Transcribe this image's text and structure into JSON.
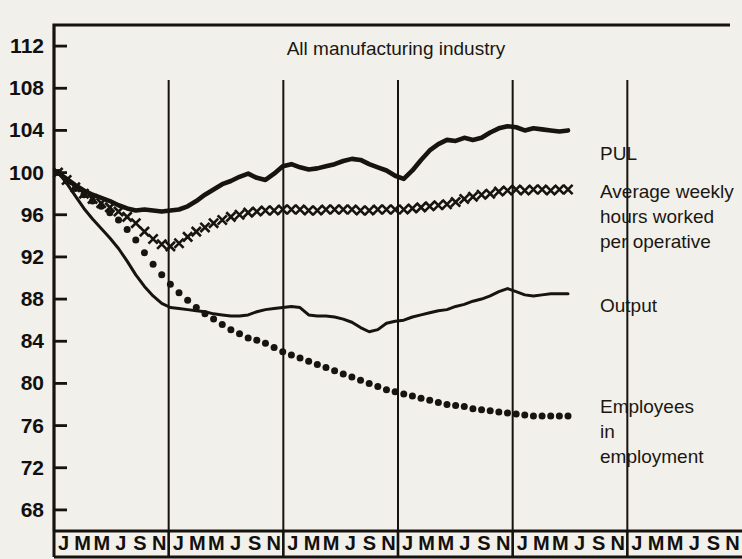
{
  "chart_data": {
    "type": "line",
    "title": "All manufacturing industry",
    "xlabel": "",
    "ylabel": "",
    "ylim": [
      66,
      114
    ],
    "yticks": [
      68,
      72,
      76,
      80,
      84,
      88,
      92,
      96,
      100,
      104,
      108,
      112
    ],
    "grid": "vertical year dividers only",
    "legend_position": "right",
    "x_tick_labels": [
      "J",
      "M",
      "M",
      "J",
      "S",
      "N",
      "J",
      "M",
      "M",
      "J",
      "S",
      "N",
      "J",
      "M",
      "M",
      "J",
      "S",
      "N",
      "J",
      "M",
      "M",
      "J",
      "S",
      "N",
      "J",
      "M",
      "M",
      "J",
      "S",
      "N",
      "J",
      "M",
      "M",
      "J",
      "S",
      "N"
    ],
    "x_group_pattern": [
      "J",
      "M",
      "M",
      "J",
      "S",
      "N"
    ],
    "n_year_groups": 6,
    "index_base": 100,
    "series": [
      {
        "name": "PUL",
        "style": "thick-solid",
        "values": [
          100.0,
          99.4,
          98.8,
          98.3,
          97.9,
          97.6,
          97.3,
          96.9,
          96.6,
          96.4,
          96.5,
          96.4,
          96.3,
          96.4,
          96.5,
          96.8,
          97.3,
          97.9,
          98.4,
          98.9,
          99.2,
          99.6,
          99.9,
          99.5,
          99.3,
          99.9,
          100.6,
          100.8,
          100.5,
          100.3,
          100.4,
          100.6,
          100.8,
          101.1,
          101.3,
          101.2,
          100.8,
          100.5,
          100.2,
          99.7,
          99.4,
          100.2,
          101.2,
          102.1,
          102.7,
          103.1,
          103.0,
          103.3,
          103.1,
          103.3,
          103.8,
          104.2,
          104.4,
          104.3,
          104.0,
          104.2,
          104.1,
          104.0,
          103.9,
          104.0
        ]
      },
      {
        "name": "Average weekly hours worked per operative",
        "style": "cross-markers",
        "values": [
          100.0,
          99.3,
          98.6,
          98.0,
          97.5,
          97.1,
          96.7,
          96.3,
          95.8,
          95.2,
          94.4,
          93.7,
          93.2,
          93.0,
          93.3,
          93.9,
          94.4,
          94.8,
          95.2,
          95.5,
          95.8,
          96.0,
          96.2,
          96.3,
          96.4,
          96.4,
          96.5,
          96.5,
          96.5,
          96.4,
          96.4,
          96.5,
          96.5,
          96.5,
          96.5,
          96.4,
          96.4,
          96.5,
          96.5,
          96.5,
          96.5,
          96.6,
          96.7,
          96.8,
          96.9,
          97.0,
          97.2,
          97.5,
          97.7,
          97.9,
          98.0,
          98.2,
          98.3,
          98.4,
          98.3,
          98.4,
          98.4,
          98.3,
          98.4,
          98.4
        ]
      },
      {
        "name": "Output",
        "style": "thin-solid",
        "values": [
          100.0,
          99.0,
          97.8,
          96.6,
          95.6,
          94.7,
          93.8,
          92.8,
          91.6,
          90.3,
          89.2,
          88.3,
          87.6,
          87.2,
          87.1,
          87.0,
          86.9,
          86.8,
          86.6,
          86.5,
          86.4,
          86.4,
          86.5,
          86.8,
          87.0,
          87.1,
          87.2,
          87.3,
          87.2,
          86.5,
          86.4,
          86.4,
          86.3,
          86.1,
          85.8,
          85.3,
          84.9,
          85.1,
          85.7,
          85.9,
          86.0,
          86.3,
          86.5,
          86.7,
          86.9,
          87.0,
          87.3,
          87.5,
          87.8,
          88.0,
          88.3,
          88.7,
          89.0,
          88.7,
          88.4,
          88.3,
          88.4,
          88.5,
          88.5,
          88.5
        ]
      },
      {
        "name": "Employees in employment",
        "style": "dot-markers",
        "values": [
          100.0,
          99.2,
          98.5,
          97.9,
          97.3,
          96.8,
          96.2,
          95.5,
          94.6,
          93.6,
          92.4,
          91.3,
          90.3,
          89.4,
          88.6,
          87.9,
          87.2,
          86.6,
          86.1,
          85.6,
          85.1,
          84.7,
          84.3,
          84.1,
          83.8,
          83.4,
          83.0,
          82.7,
          82.4,
          82.1,
          81.8,
          81.5,
          81.2,
          80.9,
          80.6,
          80.3,
          80.0,
          79.7,
          79.4,
          79.2,
          79.0,
          78.8,
          78.6,
          78.4,
          78.2,
          78.0,
          77.9,
          77.8,
          77.6,
          77.5,
          77.4,
          77.3,
          77.2,
          77.1,
          77.0,
          76.9,
          76.9,
          76.9,
          76.9,
          76.9
        ]
      }
    ],
    "annotations": [
      {
        "text": "PUL",
        "x_px": 600,
        "y_px": 160
      },
      {
        "text": "Average weekly",
        "x_px": 600,
        "y_px": 198
      },
      {
        "text": "hours worked",
        "x_px": 600,
        "y_px": 223
      },
      {
        "text": "per operative",
        "x_px": 600,
        "y_px": 248
      },
      {
        "text": "Output",
        "x_px": 600,
        "y_px": 312
      },
      {
        "text": "Employees",
        "x_px": 600,
        "y_px": 413
      },
      {
        "text": "in",
        "x_px": 600,
        "y_px": 438
      },
      {
        "text": "employment",
        "x_px": 600,
        "y_px": 463
      }
    ],
    "colors": {
      "background": "#f2f0ea",
      "ink": "#17130f"
    }
  },
  "legend": {
    "pul": "PUL",
    "hours_line1": "Average weekly",
    "hours_line2": "hours worked",
    "hours_line3": "per operative",
    "output": "Output",
    "employees_line1": "Employees",
    "employees_line2": "in",
    "employees_line3": "employment"
  },
  "axis": {
    "y_labels": [
      "112",
      "108",
      "104",
      "100",
      "96",
      "92",
      "88",
      "84",
      "80",
      "76",
      "72",
      "68"
    ]
  },
  "title": "All manufacturing industry"
}
